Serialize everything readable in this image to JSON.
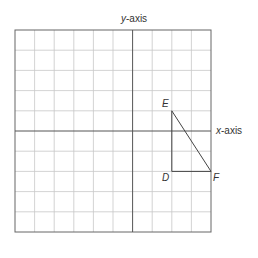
{
  "labels": {
    "y_axis_prefix": "y",
    "y_axis_suffix": "-axis",
    "x_axis_prefix": "x",
    "x_axis_suffix": "-axis",
    "point_e": "E",
    "point_d": "D",
    "point_f": "F"
  },
  "grid": {
    "columns": 10,
    "rows": 10,
    "y_axis_column": 6,
    "x_axis_row": 5
  },
  "triangle": {
    "E": [
      8,
      4
    ],
    "D": [
      8,
      7
    ],
    "F": [
      10,
      7
    ]
  },
  "colors": {
    "grid": "#c8c8c8",
    "axis": "#555555",
    "border": "#666666",
    "shape": "#444444"
  }
}
